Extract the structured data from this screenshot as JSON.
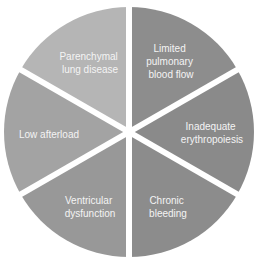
{
  "diagram": {
    "type": "segmented-circle",
    "center": [
      129,
      132
    ],
    "radius": 125,
    "gap_color": "#ffffff",
    "segments": [
      {
        "id": "limited-pulmonary-blood-flow",
        "lines": [
          "Limited",
          "pulmonary",
          "blood flow"
        ],
        "color": "#8d8d8d"
      },
      {
        "id": "inadequate-erythropoiesis",
        "lines": [
          "Inadequate",
          "erythropoiesis"
        ],
        "color": "#8a8a8a"
      },
      {
        "id": "chronic-bleeding",
        "lines": [
          "Chronic",
          "bleeding"
        ],
        "color": "#8c8c8c"
      },
      {
        "id": "ventricular-dysfunction",
        "lines": [
          "Ventricular",
          "dysfunction"
        ],
        "color": "#989898"
      },
      {
        "id": "low-afterload",
        "lines": [
          "Low afterload"
        ],
        "color": "#a3a3a3"
      },
      {
        "id": "parenchymal-lung-disease",
        "lines": [
          "Parenchymal",
          "lung disease"
        ],
        "color": "#b5b5b5"
      }
    ]
  }
}
